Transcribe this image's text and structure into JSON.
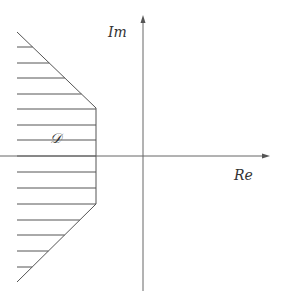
{
  "diagram": {
    "type": "complex-plane-region",
    "labels": {
      "imaginary_axis": "Im",
      "real_axis": "Re",
      "region": "𝒟"
    },
    "colors": {
      "line": "#555555",
      "axis": "#666666",
      "background": "#ffffff"
    },
    "axes": {
      "origin": [
        143,
        156
      ],
      "real_axis": {
        "x_start": 0,
        "x_end": 270,
        "y": 156
      },
      "imag_axis": {
        "x": 143,
        "y_start": 15,
        "y_end": 291
      }
    },
    "region_boundary": [
      [
        17,
        32
      ],
      [
        96,
        108
      ],
      [
        96,
        204
      ],
      [
        17,
        282
      ]
    ],
    "hatch_lines_y": [
      47,
      63,
      78,
      94,
      109,
      125,
      140,
      156,
      172,
      188,
      204,
      220,
      235,
      251,
      267
    ],
    "hatch_x_left": 17
  }
}
